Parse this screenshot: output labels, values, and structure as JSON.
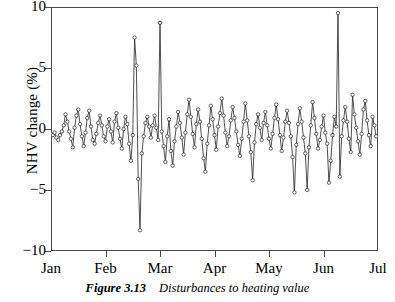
{
  "figure": {
    "caption_number": "Figure 3.13",
    "caption_text": "Disturbances to heating value"
  },
  "chart_data": {
    "type": "line",
    "title": "",
    "xlabel": "",
    "ylabel": "NHV change (%)",
    "xlim": [
      0,
      6
    ],
    "ylim": [
      -10,
      10
    ],
    "grid": false,
    "legend": "none",
    "marker": "open-circle",
    "line_color": "#222222",
    "marker_color": "#222222",
    "xtick_labels": [
      "Jan",
      "Feb",
      "Mar",
      "Apr",
      "May",
      "Jun",
      "Jul"
    ],
    "xtick_values": [
      0,
      1,
      2,
      3,
      4,
      5,
      6
    ],
    "ytick_labels": [
      "10",
      "5",
      "0",
      "-5",
      "-10"
    ],
    "ytick_values": [
      10,
      5,
      0,
      -5,
      -10
    ],
    "series": [
      {
        "name": "NHV change",
        "x": [
          0.0,
          0.033,
          0.066,
          0.1,
          0.133,
          0.166,
          0.2,
          0.233,
          0.266,
          0.3,
          0.333,
          0.366,
          0.4,
          0.433,
          0.466,
          0.5,
          0.533,
          0.566,
          0.6,
          0.633,
          0.666,
          0.7,
          0.733,
          0.766,
          0.8,
          0.833,
          0.866,
          0.9,
          0.933,
          0.966,
          1.0,
          1.033,
          1.066,
          1.1,
          1.133,
          1.166,
          1.2,
          1.233,
          1.266,
          1.3,
          1.333,
          1.366,
          1.4,
          1.433,
          1.466,
          1.5,
          1.533,
          1.566,
          1.6,
          1.633,
          1.666,
          1.7,
          1.733,
          1.766,
          1.8,
          1.833,
          1.866,
          1.9,
          1.933,
          1.966,
          2.0,
          2.033,
          2.066,
          2.1,
          2.133,
          2.166,
          2.2,
          2.233,
          2.266,
          2.3,
          2.333,
          2.366,
          2.4,
          2.433,
          2.466,
          2.5,
          2.533,
          2.566,
          2.6,
          2.633,
          2.666,
          2.7,
          2.733,
          2.766,
          2.8,
          2.833,
          2.866,
          2.9,
          2.933,
          2.966,
          3.0,
          3.033,
          3.066,
          3.1,
          3.133,
          3.166,
          3.2,
          3.233,
          3.266,
          3.3,
          3.333,
          3.366,
          3.4,
          3.433,
          3.466,
          3.5,
          3.533,
          3.566,
          3.6,
          3.633,
          3.666,
          3.7,
          3.733,
          3.766,
          3.8,
          3.833,
          3.866,
          3.9,
          3.933,
          3.966,
          4.0,
          4.033,
          4.066,
          4.1,
          4.133,
          4.166,
          4.2,
          4.233,
          4.266,
          4.3,
          4.333,
          4.366,
          4.4,
          4.433,
          4.466,
          4.5,
          4.533,
          4.566,
          4.6,
          4.633,
          4.666,
          4.7,
          4.733,
          4.766,
          4.8,
          4.833,
          4.866,
          4.9,
          4.933,
          4.966,
          5.0,
          5.033,
          5.066,
          5.1,
          5.133,
          5.166,
          5.2,
          5.233,
          5.266,
          5.3,
          5.333,
          5.366,
          5.4,
          5.433,
          5.466,
          5.5,
          5.533,
          5.566,
          5.6,
          5.633,
          5.666,
          5.7,
          5.733,
          5.766,
          5.8,
          5.833,
          5.866,
          5.9,
          5.933,
          5.966
        ],
        "values": [
          -0.4,
          -0.5,
          -0.3,
          -0.7,
          -0.9,
          -0.5,
          -0.2,
          0.3,
          1.2,
          0.6,
          -0.2,
          -0.8,
          -1.5,
          0.1,
          1.1,
          1.6,
          0.4,
          -0.6,
          -1.4,
          -0.3,
          0.9,
          1.5,
          0.2,
          -0.9,
          -1.2,
          -0.4,
          0.5,
          1.1,
          0.3,
          -0.6,
          -1.0,
          0.2,
          0.8,
          -0.2,
          -1.1,
          0.6,
          1.3,
          0.1,
          -0.8,
          -1.6,
          0.0,
          1.0,
          0.4,
          -1.2,
          -2.6,
          -0.5,
          7.5,
          5.2,
          -4.1,
          -8.3,
          -2.0,
          -0.6,
          0.5,
          1.0,
          0.2,
          -0.7,
          0.3,
          1.1,
          0.1,
          -0.9,
          8.7,
          -0.2,
          -1.4,
          -2.7,
          -0.6,
          0.8,
          -1.8,
          -3.0,
          -1.0,
          0.2,
          1.4,
          0.5,
          -0.7,
          -2.1,
          -0.3,
          1.2,
          2.4,
          1.0,
          -0.4,
          -1.5,
          0.4,
          1.6,
          0.6,
          -0.8,
          -2.4,
          -3.5,
          -1.2,
          0.3,
          1.9,
          0.8,
          -0.5,
          -1.7,
          0.2,
          1.3,
          2.5,
          1.1,
          -0.3,
          -1.4,
          -0.6,
          0.7,
          1.8,
          0.9,
          -0.2,
          -1.3,
          -2.2,
          -0.8,
          0.6,
          2.1,
          0.7,
          -0.6,
          -1.9,
          -4.2,
          -1.1,
          0.4,
          1.2,
          0.1,
          -0.9,
          0.5,
          1.4,
          0.3,
          -0.8,
          -1.6,
          -0.4,
          0.9,
          2.0,
          0.8,
          -0.5,
          -1.8,
          -0.7,
          0.6,
          1.5,
          0.5,
          -0.6,
          -2.3,
          -5.2,
          -1.3,
          0.4,
          1.7,
          0.6,
          -0.7,
          -2.0,
          -5.0,
          -1.5,
          0.3,
          2.2,
          0.9,
          -0.4,
          -1.6,
          -0.9,
          0.2,
          1.1,
          -0.3,
          -1.2,
          -4.4,
          -2.6,
          -0.5,
          1.0,
          0.2,
          9.5,
          -3.9,
          -0.6,
          0.7,
          1.8,
          0.6,
          -0.8,
          -1.9,
          2.8,
          1.2,
          0.1,
          -1.0,
          -2.1,
          -0.4,
          1.6,
          2.3,
          0.7,
          -0.5,
          -1.4,
          1.0,
          0.3,
          -0.6
        ]
      }
    ]
  }
}
